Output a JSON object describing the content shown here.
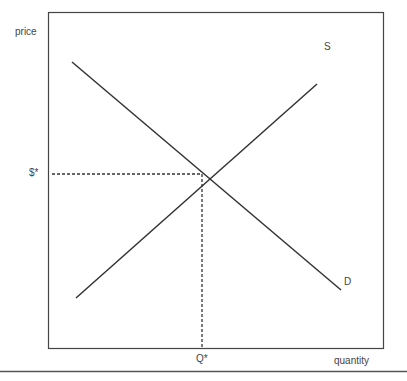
{
  "diagram": {
    "type": "supply-demand",
    "y_axis_label": "price",
    "x_axis_label": "quantity",
    "supply_label": "S",
    "demand_label": "D",
    "equilibrium_price_label": "$*",
    "equilibrium_quantity_label": "Q*",
    "colors": {
      "line": "#333333",
      "frame": "#444444"
    }
  }
}
